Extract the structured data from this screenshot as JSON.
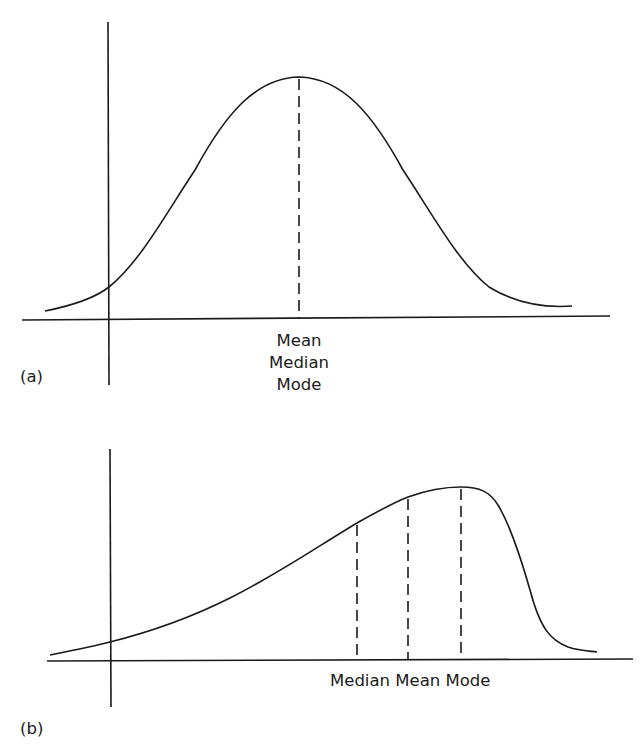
{
  "panels": [
    {
      "id": "a",
      "label": "(a)",
      "shape": "symmetric",
      "center_labels": [
        "Mean",
        "Median",
        "Mode"
      ]
    },
    {
      "id": "b",
      "label": "(b)",
      "shape": "negatively skewed",
      "marker_labels": [
        "Median",
        "Mean",
        "Mode"
      ],
      "marker_label_text": "Median Mean Mode"
    }
  ],
  "colors": {
    "ink": "#1a1a1a",
    "background": "#ffffff"
  }
}
